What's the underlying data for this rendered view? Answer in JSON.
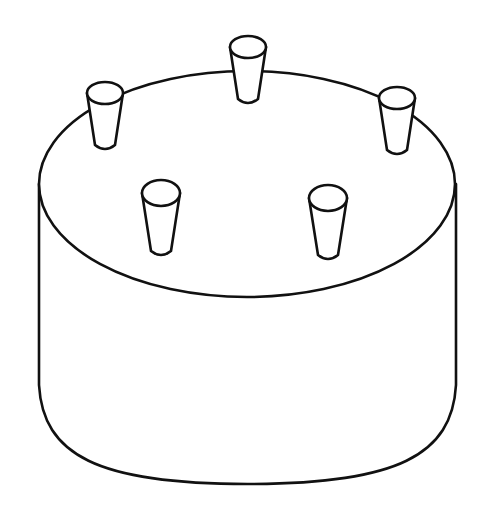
{
  "figure": {
    "style": "black line drawing on white",
    "colors": {
      "background": "#ffffff",
      "stroke": "#111111"
    },
    "cylinder": {
      "top_ellipse": {
        "cx": 247,
        "cy": 184,
        "rx": 208,
        "ry": 113
      },
      "left_wall_x": 39,
      "right_wall_x": 456,
      "wall_bottom_y": 385,
      "bottom_arc_lowest_y": 484
    },
    "pegs": [
      {
        "name": "peg-back-center",
        "cx": 248,
        "top_cy": 47,
        "top_rx": 18,
        "top_ry": 11,
        "bottom_y": 103,
        "bottom_half_width": 10
      },
      {
        "name": "peg-back-left",
        "cx": 105,
        "top_cy": 93,
        "top_rx": 18,
        "top_ry": 11,
        "bottom_y": 149,
        "bottom_half_width": 10
      },
      {
        "name": "peg-back-right",
        "cx": 397,
        "top_cy": 98,
        "top_rx": 18,
        "top_ry": 11,
        "bottom_y": 154,
        "bottom_half_width": 10
      },
      {
        "name": "peg-front-left",
        "cx": 161,
        "top_cy": 193,
        "top_rx": 19,
        "top_ry": 13,
        "bottom_y": 255,
        "bottom_half_width": 10
      },
      {
        "name": "peg-front-right",
        "cx": 328,
        "top_cy": 198,
        "top_rx": 19,
        "top_ry": 13,
        "bottom_y": 259,
        "bottom_half_width": 10
      }
    ]
  }
}
